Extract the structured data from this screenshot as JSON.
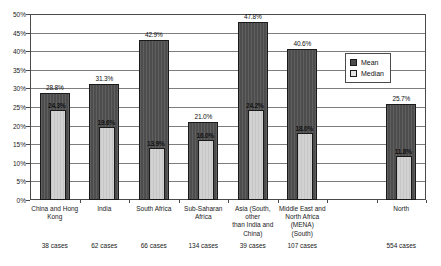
{
  "chart_data": {
    "type": "bar",
    "title": "",
    "xlabel": "",
    "ylabel": "",
    "ylim": [
      0,
      50
    ],
    "ytick_step": 5,
    "grid": true,
    "legend_position": "inside-top-right",
    "categories": [
      "China and Hong Kong",
      "India",
      "South Africa",
      "Sub-Saharan Africa",
      "Asia (South, other than India and China)",
      "Middle East and North Africa (MENA) (South)",
      "",
      "North"
    ],
    "category_lines": [
      [
        "China and Hong",
        "Kong"
      ],
      [
        "India"
      ],
      [
        "South Africa"
      ],
      [
        "Sub-Saharan",
        "Africa"
      ],
      [
        "Asia (South,",
        "other",
        "than India and",
        "China)"
      ],
      [
        "Middle East and",
        "North Africa",
        "(MENA)",
        "(South)"
      ],
      [
        ""
      ],
      [
        "North"
      ]
    ],
    "case_counts": [
      "38 cases",
      "62 cases",
      "66 cases",
      "134 cases",
      "39 cases",
      "107 cases",
      "",
      "554 cases"
    ],
    "series": [
      {
        "name": "Mean",
        "color": "#4d4d4d",
        "values": [
          28.8,
          31.3,
          42.9,
          21.0,
          47.8,
          40.6,
          null,
          25.7
        ],
        "labels": [
          "28.8%",
          "31.3%",
          "42.9%",
          "21.0%",
          "47.8%",
          "40.6%",
          "",
          "25.7%"
        ]
      },
      {
        "name": "Median",
        "color": "#d2d2d2",
        "values": [
          24.3,
          19.6,
          13.9,
          16.0,
          24.2,
          18.0,
          null,
          11.8
        ],
        "labels": [
          "24.3%",
          "19.6%",
          "13.9%",
          "16.0%",
          "24.2%",
          "18.0%",
          "",
          "11.8%"
        ]
      }
    ],
    "ytick_labels": [
      "0%",
      "5%",
      "10%",
      "15%",
      "20%",
      "25%",
      "30%",
      "35%",
      "40%",
      "45%",
      "50%"
    ]
  },
  "legend": {
    "items": [
      {
        "label": "Mean",
        "swatch": "mean-swatch"
      },
      {
        "label": "Median",
        "swatch": "median-swatch"
      }
    ]
  }
}
